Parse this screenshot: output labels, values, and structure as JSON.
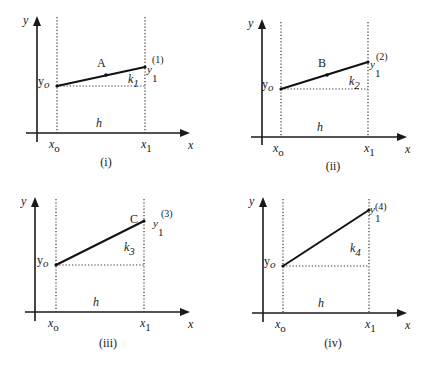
{
  "figure": {
    "labels": {
      "y_axis": "y",
      "x_axis": "x",
      "x0": "x",
      "x0_sub": "o",
      "x1": "x",
      "x1_sub": "1",
      "y0": "y",
      "y0_sub": "o",
      "h": "h",
      "y1": "y",
      "y1_sub": "1"
    },
    "panels": [
      {
        "id": "i",
        "caption": "(i)",
        "point_label": "A",
        "slope_label": "k",
        "slope_sub": "1",
        "y1_sup": "(1)",
        "has_midpoint_dot": true,
        "geom": {
          "yaxis_x": 37,
          "yaxis_top": 16,
          "yaxis_bottom": 142,
          "xaxis_y": 133,
          "xaxis_left": 26,
          "xaxis_right": 190,
          "x0": 57,
          "x1": 145,
          "dot_top": 17,
          "y0": 86,
          "y1": 67,
          "mid": [
            106,
            75
          ],
          "label_pos": [
            97,
            67
          ],
          "k_pos": [
            128,
            83
          ],
          "y1_pos": [
            147,
            73
          ],
          "sup_pos": [
            152,
            63
          ],
          "h_pos": [
            96,
            127
          ],
          "caption_pos": [
            106,
            166
          ]
        }
      },
      {
        "id": "ii",
        "caption": "(ii)",
        "point_label": "B",
        "slope_label": "k",
        "slope_sub": "2",
        "y1_sup": "(2)",
        "has_midpoint_dot": true,
        "geom": {
          "yaxis_x": 262,
          "yaxis_top": 19,
          "yaxis_bottom": 145,
          "xaxis_y": 137,
          "xaxis_left": 251,
          "xaxis_right": 407,
          "x0": 281,
          "x1": 368,
          "dot_top": 22,
          "y0": 89,
          "y1": 62,
          "mid": [
            327,
            75
          ],
          "label_pos": [
            318,
            67
          ],
          "k_pos": [
            349,
            85
          ],
          "y1_pos": [
            370,
            68
          ],
          "sup_pos": [
            376,
            60
          ],
          "h_pos": [
            317,
            131
          ],
          "caption_pos": [
            333,
            170
          ]
        }
      },
      {
        "id": "iii",
        "caption": "(iii)",
        "point_label": "C",
        "slope_label": "k",
        "slope_sub": "3",
        "y1_sup": "(3)",
        "has_midpoint_dot": false,
        "geom": {
          "yaxis_x": 35,
          "yaxis_top": 197,
          "yaxis_bottom": 321,
          "xaxis_y": 312,
          "xaxis_left": 25,
          "xaxis_right": 190,
          "x0": 56,
          "x1": 144,
          "dot_top": 199,
          "y0": 265,
          "y1": 221,
          "mid": null,
          "label_pos": [
            130,
            223
          ],
          "k_pos": [
            124,
            251
          ],
          "y1_pos": [
            153,
            227
          ],
          "sup_pos": [
            161,
            217
          ],
          "h_pos": [
            93,
            306
          ],
          "caption_pos": [
            108,
            347
          ]
        }
      },
      {
        "id": "iv",
        "caption": "(iv)",
        "point_label": "",
        "slope_label": "k",
        "slope_sub": "4",
        "y1_sup": "(4)",
        "has_midpoint_dot": false,
        "geom": {
          "yaxis_x": 263,
          "yaxis_top": 197,
          "yaxis_bottom": 322,
          "xaxis_y": 313,
          "xaxis_left": 252,
          "xaxis_right": 407,
          "x0": 283,
          "x1": 369,
          "dot_top": 199,
          "y0": 266,
          "y1": 210,
          "mid": null,
          "label_pos": [
            0,
            0
          ],
          "k_pos": [
            350,
            252
          ],
          "y1_pos": [
            370,
            213
          ],
          "sup_pos": [
            375,
            210
          ],
          "h_pos": [
            318,
            307
          ],
          "caption_pos": [
            333,
            347
          ]
        }
      }
    ]
  }
}
